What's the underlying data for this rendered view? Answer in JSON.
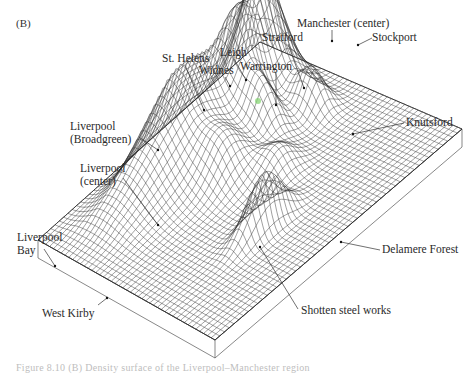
{
  "figure": {
    "panel_label": "(B)",
    "type": "3D wireframe surface",
    "line_color": "#2b2b2b",
    "background": "#ffffff",
    "highlight_color": "#7fd36b"
  },
  "labels": [
    {
      "id": "manchester-center",
      "text": "Manchester (center)",
      "x": 297,
      "y": 17
    },
    {
      "id": "stockport",
      "text": "Stockport",
      "x": 372,
      "y": 31
    },
    {
      "id": "stratford",
      "text": "Stratford",
      "x": 262,
      "y": 31
    },
    {
      "id": "leigh",
      "text": "Leigh",
      "x": 220,
      "y": 46
    },
    {
      "id": "st-helens",
      "text": "St. Helens",
      "x": 162,
      "y": 52
    },
    {
      "id": "warrington",
      "text": "Warrington",
      "x": 240,
      "y": 60
    },
    {
      "id": "widnes",
      "text": "Widnes",
      "x": 199,
      "y": 64
    },
    {
      "id": "knutsford",
      "text": "Knutsford",
      "x": 406,
      "y": 116
    },
    {
      "id": "liverpool-broadgreen",
      "text": "Liverpool\n(Broadgreen)",
      "x": 70,
      "y": 120
    },
    {
      "id": "liverpool-center",
      "text": "Liverpool\n(center)",
      "x": 80,
      "y": 162
    },
    {
      "id": "liverpool-bay",
      "text": "Liverpool\nBay",
      "x": 17,
      "y": 231
    },
    {
      "id": "west-kirby",
      "text": "West Kirby",
      "x": 42,
      "y": 307
    },
    {
      "id": "delamere-forest",
      "text": "Delamere Forest",
      "x": 382,
      "y": 243
    },
    {
      "id": "shotten-steel-works",
      "text": "Shotten steel works",
      "x": 301,
      "y": 304
    }
  ],
  "leaders": [
    {
      "id": "manchester-center",
      "x1": 332,
      "y1": 30,
      "x2": 332,
      "y2": 41
    },
    {
      "id": "stockport",
      "x1": 372,
      "y1": 38,
      "x2": 358,
      "y2": 45
    },
    {
      "id": "stratford",
      "x1": 288,
      "y1": 44,
      "x2": 304,
      "y2": 88
    },
    {
      "id": "leigh",
      "x1": 234,
      "y1": 59,
      "x2": 246,
      "y2": 80
    },
    {
      "id": "st-helens",
      "x1": 185,
      "y1": 65,
      "x2": 204,
      "y2": 110
    },
    {
      "id": "warrington",
      "x1": 276,
      "y1": 73,
      "x2": 276,
      "y2": 105
    },
    {
      "id": "widnes",
      "x1": 225,
      "y1": 77,
      "x2": 230,
      "y2": 86
    },
    {
      "id": "knutsford",
      "x1": 404,
      "y1": 123,
      "x2": 353,
      "y2": 134
    },
    {
      "id": "liverpool-broadgreen",
      "x1": 139,
      "y1": 137,
      "x2": 158,
      "y2": 150
    },
    {
      "id": "liverpool-center",
      "x1": 123,
      "y1": 178,
      "x2": 158,
      "y2": 225
    },
    {
      "id": "liverpool-bay",
      "x1": 44,
      "y1": 249,
      "x2": 55,
      "y2": 266
    },
    {
      "id": "west-kirby",
      "x1": 98,
      "y1": 305,
      "x2": 107,
      "y2": 298
    },
    {
      "id": "delamere-forest",
      "x1": 380,
      "y1": 250,
      "x2": 341,
      "y2": 242
    },
    {
      "id": "shotten-steel-works",
      "x1": 298,
      "y1": 309,
      "x2": 260,
      "y2": 247
    }
  ],
  "caption": {
    "text": "Figure 8.10 (B) Density surface of the Liverpool–Manchester region"
  }
}
